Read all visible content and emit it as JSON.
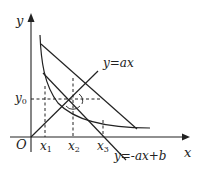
{
  "diagram": {
    "axes": {
      "x_label": "x",
      "y_label": "y",
      "origin_label": "O"
    },
    "ticks": {
      "y0_label": "y",
      "y0_sub": "0",
      "x1_label": "x",
      "x1_sub": "1",
      "x2_label": "x",
      "x2_sub": "2",
      "x3_label": "x",
      "x3_sub": "3"
    },
    "lines": {
      "line_ax_label": "y=ax",
      "line_neg_ax_b_label": "y=-ax+b"
    },
    "colors": {
      "stroke": "#222222",
      "background": "#ffffff"
    }
  }
}
